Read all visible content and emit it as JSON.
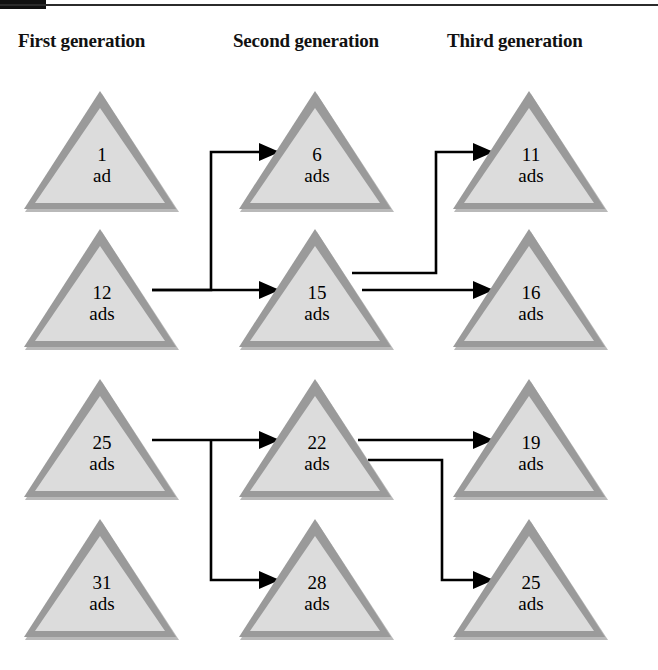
{
  "page": {
    "background": "#ffffff",
    "width": 658,
    "height": 670
  },
  "decor": {
    "top_rule_color": "#2b2b2b",
    "corner_block_color": "#111111"
  },
  "headers": [
    {
      "id": "first",
      "label": "First generation"
    },
    {
      "id": "second",
      "label": "Second generation"
    },
    {
      "id": "third",
      "label": "Third generation"
    }
  ],
  "style": {
    "triangle_fill": "#dcdcdc",
    "triangle_border": "#9a9a9a",
    "triangle_shadow": "#b9b9b9",
    "triangle_inner_highlight": "#f2f2f2",
    "text_color": "#000000",
    "wire_color": "#000000"
  },
  "nodes": [
    {
      "id": "n1",
      "column": "first",
      "row": 1,
      "number": "1",
      "unit": "ad"
    },
    {
      "id": "n2",
      "column": "second",
      "row": 1,
      "number": "6",
      "unit": "ads"
    },
    {
      "id": "n3",
      "column": "third",
      "row": 1,
      "number": "11",
      "unit": "ads"
    },
    {
      "id": "n4",
      "column": "first",
      "row": 2,
      "number": "12",
      "unit": "ads"
    },
    {
      "id": "n5",
      "column": "second",
      "row": 2,
      "number": "15",
      "unit": "ads"
    },
    {
      "id": "n6",
      "column": "third",
      "row": 2,
      "number": "16",
      "unit": "ads"
    },
    {
      "id": "n7",
      "column": "first",
      "row": 3,
      "number": "25",
      "unit": "ads"
    },
    {
      "id": "n8",
      "column": "second",
      "row": 3,
      "number": "22",
      "unit": "ads"
    },
    {
      "id": "n9",
      "column": "third",
      "row": 3,
      "number": "19",
      "unit": "ads"
    },
    {
      "id": "n10",
      "column": "first",
      "row": 4,
      "number": "31",
      "unit": "ads"
    },
    {
      "id": "n11",
      "column": "second",
      "row": 4,
      "number": "28",
      "unit": "ads"
    },
    {
      "id": "n12",
      "column": "third",
      "row": 4,
      "number": "25",
      "unit": "ads"
    }
  ],
  "connections": [
    {
      "id": "c1",
      "from": "n4",
      "to": "n2",
      "note": "12 ads up to 6 ads"
    },
    {
      "id": "c2",
      "from": "n4",
      "to": "n5",
      "note": "12 ads across to 15 ads"
    },
    {
      "id": "c3",
      "from": "n5",
      "to": "n3",
      "note": "15 ads up to 11 ads"
    },
    {
      "id": "c4",
      "from": "n5",
      "to": "n6",
      "note": "15 ads across to 16 ads"
    },
    {
      "id": "c5",
      "from": "n7",
      "to": "n8",
      "note": "25 ads across to 22 ads"
    },
    {
      "id": "c6",
      "from": "n7",
      "to": "n11",
      "note": "25 ads down to 28 ads"
    },
    {
      "id": "c7",
      "from": "n8",
      "to": "n9",
      "note": "22 ads across to 19 ads"
    },
    {
      "id": "c8",
      "from": "n8",
      "to": "n12",
      "note": "22 ads down to 25 ads"
    }
  ]
}
